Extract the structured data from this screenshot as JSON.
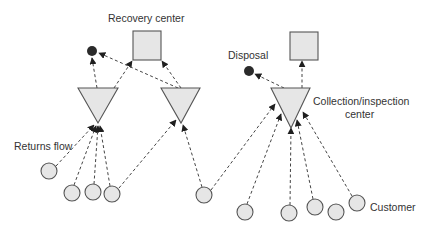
{
  "diagram": {
    "labels": {
      "recovery_center": "Recovery center",
      "disposal": "Disposal",
      "collection_line1": "Collection/inspection",
      "collection_line2": "center",
      "returns_flow": "Returns flow",
      "customer": "Customer"
    },
    "colors": {
      "node_fill": "#e6e6e6",
      "node_stroke": "#555555",
      "edge": "#444444",
      "disposal_dot": "#2b2b2b",
      "text": "#333333"
    },
    "nodes": {
      "recovery_centers": [
        {
          "id": "R1",
          "x": 133,
          "y": 31,
          "w": 28,
          "h": 29
        },
        {
          "id": "R2",
          "x": 290,
          "y": 32,
          "w": 28,
          "h": 28
        }
      ],
      "disposal_points": [
        {
          "id": "D1",
          "cx": 92,
          "cy": 51,
          "r": 5
        },
        {
          "id": "D2",
          "cx": 249,
          "cy": 71,
          "r": 5
        }
      ],
      "collection_centers": [
        {
          "id": "T1",
          "left": 78,
          "right": 118,
          "top": 88,
          "apex_x": 98,
          "apex_y": 123
        },
        {
          "id": "T2",
          "left": 161,
          "right": 200,
          "top": 88,
          "apex_x": 181,
          "apex_y": 123
        },
        {
          "id": "T3",
          "left": 271,
          "right": 310,
          "top": 88,
          "apex_x": 291,
          "apex_y": 128
        }
      ],
      "customers": [
        {
          "id": "C1",
          "cx": 49,
          "cy": 171
        },
        {
          "id": "C2",
          "cx": 72,
          "cy": 193
        },
        {
          "id": "C3",
          "cx": 93,
          "cy": 192
        },
        {
          "id": "C4",
          "cx": 112,
          "cy": 194
        },
        {
          "id": "C5",
          "cx": 204,
          "cy": 195
        },
        {
          "id": "C6",
          "cx": 245,
          "cy": 212
        },
        {
          "id": "C7",
          "cx": 289,
          "cy": 213
        },
        {
          "id": "C8",
          "cx": 315,
          "cy": 207
        },
        {
          "id": "C9",
          "cx": 336,
          "cy": 212
        },
        {
          "id": "C10",
          "cx": 357,
          "cy": 203
        }
      ]
    },
    "edges": [
      {
        "from": "C1",
        "to": "T1"
      },
      {
        "from": "C2",
        "to": "T1"
      },
      {
        "from": "C3",
        "to": "T1"
      },
      {
        "from": "C4",
        "to": "T1"
      },
      {
        "from": "C4",
        "to": "T2"
      },
      {
        "from": "C5",
        "to": "T2"
      },
      {
        "from": "C5",
        "to": "T3"
      },
      {
        "from": "C6",
        "to": "T3"
      },
      {
        "from": "C7",
        "to": "T3"
      },
      {
        "from": "C8",
        "to": "T3"
      },
      {
        "from": "C10",
        "to": "T3"
      },
      {
        "from": "T1",
        "to": "D1"
      },
      {
        "from": "T1",
        "to": "R1"
      },
      {
        "from": "T2",
        "to": "D1"
      },
      {
        "from": "T2",
        "to": "R1"
      },
      {
        "from": "T3",
        "to": "D2"
      },
      {
        "from": "T3",
        "to": "R2"
      }
    ]
  }
}
